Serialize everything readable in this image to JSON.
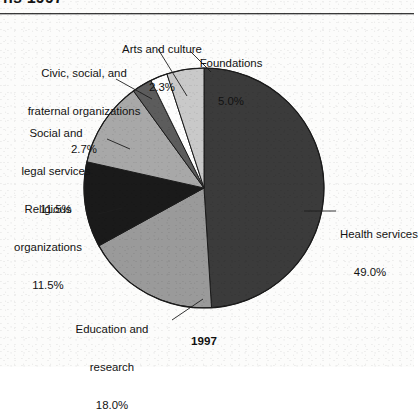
{
  "figure": {
    "title_partial": "ns 1997",
    "year_label": "1997",
    "background_color": "#ffffff",
    "text_color": "#121212"
  },
  "chart_data": {
    "type": "pie",
    "title": "1997",
    "xlabel": "",
    "ylabel": "",
    "legend_position": "none",
    "grid": false,
    "start_angle_deg": 0,
    "direction": "clockwise",
    "units": "percent",
    "center": {
      "x": 204,
      "y": 188
    },
    "radius": 120,
    "categories": [
      "Health services",
      "Education and research",
      "Religious organizations",
      "Social and legal services",
      "Civic, social, and fraternal organizations",
      "Arts and culture",
      "Foundations"
    ],
    "values": [
      49.0,
      18.0,
      11.5,
      11.5,
      2.7,
      2.3,
      5.0
    ],
    "value_labels": [
      "49.0%",
      "18.0%",
      "11.5%",
      "11.5%",
      "2.7%",
      "2.3%",
      "5.0%"
    ],
    "colors": [
      "#3b3b3b",
      "#9a9a9a",
      "#1a1a1a",
      "#a8a8a8",
      "#5c5c5c",
      "#fdfdfd",
      "#c9c9c9"
    ],
    "slices": [
      {
        "name": "health-services",
        "label_line1": "Health services",
        "label_line2": "49.0%",
        "value": 49.0,
        "color": "#3b3b3b",
        "start_deg": 0,
        "end_deg": 176.4
      },
      {
        "name": "education-and-research",
        "label_line1": "Education and",
        "label_line2": "research",
        "label_line3": "18.0%",
        "value": 18.0,
        "color": "#9a9a9a",
        "start_deg": 176.4,
        "end_deg": 241.2
      },
      {
        "name": "religious-organizations",
        "label_line1": "Religious",
        "label_line2": "organizations",
        "label_line3": "11.5%",
        "value": 11.5,
        "color": "#1a1a1a",
        "start_deg": 241.2,
        "end_deg": 282.6
      },
      {
        "name": "social-and-legal-services",
        "label_line1": "Social and",
        "label_line2": "legal services",
        "label_line3": "11.5%",
        "value": 11.5,
        "color": "#a8a8a8",
        "start_deg": 282.6,
        "end_deg": 324.0
      },
      {
        "name": "civic-social-and-fraternal-organizations",
        "label_line1": "Civic, social, and",
        "label_line2": "fraternal organizations",
        "label_line3": "2.7%",
        "value": 2.7,
        "color": "#5c5c5c",
        "start_deg": 324.0,
        "end_deg": 333.72
      },
      {
        "name": "arts-and-culture",
        "label_line1": "Arts and culture",
        "label_line2": "2.3%",
        "value": 2.3,
        "color": "#fdfdfd",
        "start_deg": 333.72,
        "end_deg": 342.0
      },
      {
        "name": "foundations",
        "label_line1": "Foundations",
        "label_line2": "5.0%",
        "value": 5.0,
        "color": "#c9c9c9",
        "start_deg": 342.0,
        "end_deg": 360.0
      }
    ]
  },
  "labels": {
    "arts_and_culture": {
      "line1": "Arts and culture",
      "line2": "2.3%"
    },
    "foundations": {
      "line1": "Foundations",
      "line2": "5.0%"
    },
    "civic": {
      "line1": "Civic, social, and",
      "line2": "fraternal organizations",
      "line3": "2.7%"
    },
    "social_legal": {
      "line1": "Social and",
      "line2": "legal services",
      "line3": "11.5%"
    },
    "religious": {
      "line1": "Religious",
      "line2": "organizations",
      "line3": "11.5%"
    },
    "education": {
      "line1": "Education and",
      "line2": "research",
      "line3": "18.0%"
    },
    "health": {
      "line1": "Health services",
      "line2": "49.0%"
    }
  }
}
